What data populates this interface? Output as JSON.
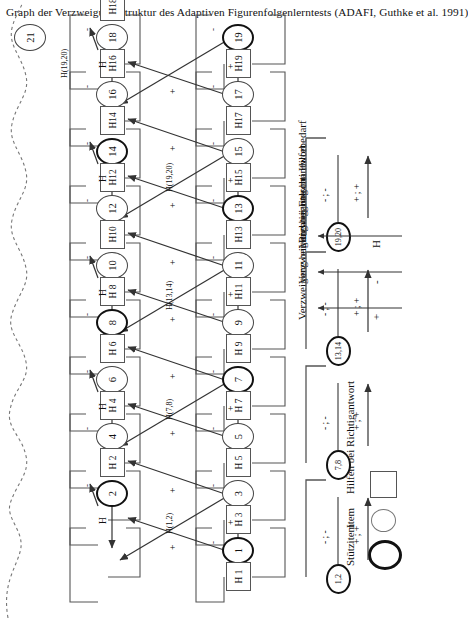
{
  "title": "Graph der Verzweigungsstruktur des Adaptiven Figurenfolgenlerntests (ADAFI, Guthke et al. 1991)",
  "legend": {
    "arrows": [
      {
        "symbol": "+",
        "text": "Verzweigung bei Richtigantwort"
      },
      {
        "symbol": "-",
        "text": "Verzweigung bei Falschantwort"
      },
      {
        "symbol": "H",
        "text": "Verzweigung bei Hilfebedarf"
      }
    ],
    "shapes": [
      {
        "shape": "thick-circle",
        "text": "Stützitem"
      },
      {
        "shape": "thin-circle",
        "text": "Item"
      },
      {
        "shape": "square",
        "text": "Hilfen bei Richtigantwort"
      }
    ]
  },
  "nodes": {
    "items": [
      {
        "id": "1",
        "label": "1",
        "type": "stuetzitem"
      },
      {
        "id": "2",
        "label": "2",
        "type": "stuetzitem"
      },
      {
        "id": "3",
        "label": "3",
        "type": "item"
      },
      {
        "id": "4",
        "label": "4",
        "type": "item"
      },
      {
        "id": "5",
        "label": "5",
        "type": "item"
      },
      {
        "id": "6",
        "label": "6",
        "type": "item"
      },
      {
        "id": "7",
        "label": "7",
        "type": "stuetzitem"
      },
      {
        "id": "8",
        "label": "8",
        "type": "stuetzitem"
      },
      {
        "id": "9",
        "label": "9",
        "type": "item"
      },
      {
        "id": "10",
        "label": "10",
        "type": "item"
      },
      {
        "id": "11",
        "label": "11",
        "type": "item"
      },
      {
        "id": "12",
        "label": "12",
        "type": "item"
      },
      {
        "id": "13",
        "label": "13",
        "type": "stuetzitem"
      },
      {
        "id": "14",
        "label": "14",
        "type": "stuetzitem"
      },
      {
        "id": "15",
        "label": "15",
        "type": "item"
      },
      {
        "id": "16",
        "label": "16",
        "type": "item"
      },
      {
        "id": "17",
        "label": "17",
        "type": "item"
      },
      {
        "id": "18",
        "label": "18",
        "type": "item"
      },
      {
        "id": "19",
        "label": "19",
        "type": "stuetzitem"
      },
      {
        "id": "20",
        "label": "20",
        "type": "stuetzitem"
      },
      {
        "id": "21",
        "label": "21",
        "type": "item"
      },
      {
        "id": "22",
        "label": "22",
        "type": "item"
      }
    ],
    "groups": [
      {
        "id": "g1",
        "label": "1,2"
      },
      {
        "id": "g2",
        "label": "7,8"
      },
      {
        "id": "g3",
        "label": "13,14"
      },
      {
        "id": "g4",
        "label": "19,20"
      }
    ],
    "helps": [
      {
        "id": "H1",
        "label": "H 1"
      },
      {
        "id": "H2",
        "label": "H 2"
      },
      {
        "id": "H3",
        "label": "H 3"
      },
      {
        "id": "H4",
        "label": "H 4"
      },
      {
        "id": "H5",
        "label": "H 5"
      },
      {
        "id": "H6",
        "label": "H 6"
      },
      {
        "id": "H7",
        "label": "H 7"
      },
      {
        "id": "H8",
        "label": "H 8"
      },
      {
        "id": "H9",
        "label": "H 9"
      },
      {
        "id": "H10",
        "label": "H10"
      },
      {
        "id": "H11",
        "label": "H11"
      },
      {
        "id": "H12",
        "label": "H12"
      },
      {
        "id": "H13",
        "label": "H13"
      },
      {
        "id": "H14",
        "label": "H14"
      },
      {
        "id": "H15",
        "label": "H15"
      },
      {
        "id": "H16",
        "label": "H16"
      },
      {
        "id": "H17",
        "label": "H17"
      },
      {
        "id": "H18",
        "label": "H18"
      },
      {
        "id": "H19",
        "label": "H19"
      },
      {
        "id": "H20",
        "label": "H20"
      }
    ]
  },
  "edge_labels": {
    "plus": "+",
    "minus": "-",
    "help": "H",
    "h_1_2": "H(1,2)",
    "h_7_8": "H(7,8)",
    "h_13_14": "H(13,14)",
    "h_19_20": "H(19,20)",
    "group_plus": "+ ; +",
    "group_minus": "- ; -"
  },
  "colors": {
    "ink": "#111111",
    "line": "#555555",
    "background": "#ffffff"
  }
}
